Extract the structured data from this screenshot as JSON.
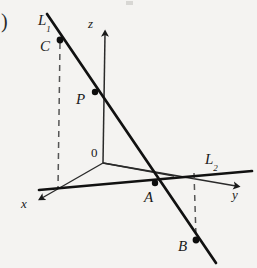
{
  "figure": {
    "type": "geometry-diagram",
    "background_color": "#f4f3f1",
    "ink_color": "#1a1a1a",
    "dash_color": "#4a4a4a",
    "labels": {
      "paren": ")",
      "line1": "L",
      "line1_sub": "1",
      "line2": "L",
      "line2_sub": "2",
      "point_c": "C",
      "point_p": "P",
      "point_a": "A",
      "point_b": "B",
      "origin": "0",
      "axis_x": "x",
      "axis_y": "y",
      "axis_z": "z"
    },
    "points": {
      "C": {
        "x": 60,
        "y": 40
      },
      "P": {
        "x": 95,
        "y": 92
      },
      "A": {
        "x": 155,
        "y": 183
      },
      "B": {
        "x": 196,
        "y": 240
      },
      "O": {
        "x": 103,
        "y": 163
      }
    },
    "lines": {
      "L1": {
        "from_x": 48,
        "from_y": 15,
        "to_x": 215,
        "to_y": 262,
        "width": 2.6
      },
      "L2": {
        "from_x": 40,
        "from_y": 190,
        "to_x": 250,
        "to_y": 172,
        "width": 2.6
      },
      "z_axis": {
        "from_x": 103,
        "from_y": 163,
        "to_x": 105,
        "to_y": 32,
        "width": 1.4
      },
      "y_axis": {
        "from_x": 103,
        "from_y": 163,
        "to_x": 238,
        "to_y": 187,
        "width": 1.4
      },
      "x_axis": {
        "from_x": 103,
        "from_y": 163,
        "to_x": 40,
        "to_y": 199,
        "width": 1.4
      },
      "x_axis_extension": {
        "from_x": 103,
        "from_y": 163,
        "to_x": 168,
        "to_y": 175,
        "width": 1.4
      }
    },
    "dashed_lines": {
      "C_drop": {
        "from_x": 60,
        "from_y": 42,
        "to_x": 58,
        "to_y": 188
      },
      "B_drop": {
        "from_x": 194,
        "from_y": 174,
        "to_x": 196,
        "to_y": 238
      }
    }
  }
}
